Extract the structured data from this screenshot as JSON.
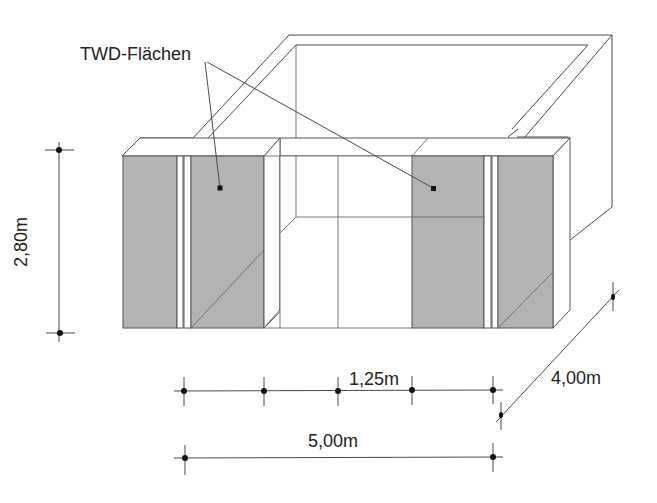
{
  "diagram": {
    "title_label": "TWD-Flächen",
    "colors": {
      "panel_fill": "#b3b3b3",
      "line": "#4a4a4a",
      "background": "#ffffff"
    },
    "dimensions": {
      "height": "2,80m",
      "module_width": "1,25m",
      "total_width": "5,00m",
      "depth": "4,00m"
    },
    "annotations": [
      {
        "label": "TWD-Flächen",
        "points_to": [
          "left TWD panel",
          "right TWD panel"
        ]
      }
    ]
  }
}
